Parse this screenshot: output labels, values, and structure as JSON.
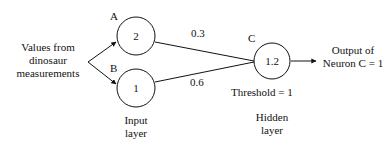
{
  "figure": {
    "type": "neural-network-diagram",
    "background_color": "#ffffff",
    "stroke_color": "#111111",
    "input_source_label": "Values from\ndinosaur\nmeasurements",
    "output_label": "Output of\nNeuron C = 1",
    "threshold_label": "Threshold = 1",
    "layers": [
      {
        "name": "input",
        "caption": "Input\nlayer"
      },
      {
        "name": "hidden",
        "caption": "Hidden\nlayer"
      }
    ],
    "nodes": [
      {
        "id": "A",
        "tag": "A",
        "value": "2",
        "layer": "input"
      },
      {
        "id": "B",
        "tag": "B",
        "value": "1",
        "layer": "input"
      },
      {
        "id": "C",
        "tag": "C",
        "value": "1.2",
        "layer": "hidden"
      }
    ],
    "edges": [
      {
        "from": "A",
        "to": "C",
        "weight": "0.3"
      },
      {
        "from": "B",
        "to": "C",
        "weight": "0.6"
      }
    ]
  }
}
